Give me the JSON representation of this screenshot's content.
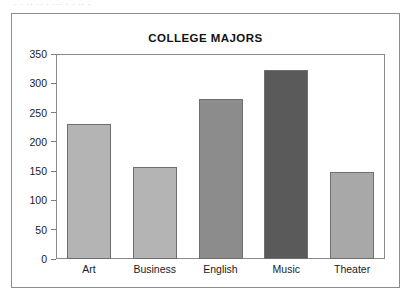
{
  "page": {
    "scan_artifact_text": "· ·   ·· ·· ·   ··· · ·  ·· ·",
    "border_color": "#8d8d8d"
  },
  "chart_data": {
    "type": "bar",
    "title": "COLLEGE MAJORS",
    "xlabel": "",
    "ylabel": "",
    "categories": [
      "Art",
      "Business",
      "English",
      "Music",
      "Theater"
    ],
    "values": [
      230,
      157,
      273,
      322,
      148
    ],
    "bar_colors": [
      "#b4b4b4",
      "#b4b4b4",
      "#8c8c8c",
      "#5a5a5a",
      "#a8a8a8"
    ],
    "bar_border_color": "#6e6e6e",
    "ylim": [
      0,
      350
    ],
    "ytick_labels": [
      "0",
      "50",
      "100",
      "150",
      "200",
      "250",
      "300",
      "350"
    ],
    "ytick_values": [
      0,
      50,
      100,
      150,
      200,
      250,
      300,
      350
    ],
    "grid": true,
    "grid_color": "#999999",
    "legend": null,
    "legend_position": "none",
    "axis_color": "#8a8a8a",
    "background": "#ffffff"
  }
}
